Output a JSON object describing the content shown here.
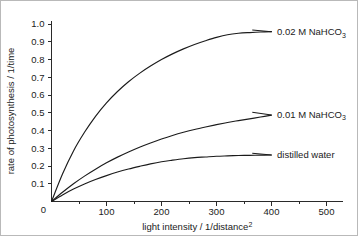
{
  "figure": {
    "background_color": "#ffffff",
    "border_color": "#b9b9b9",
    "line_color": "#1b1b1b"
  },
  "chart_data": {
    "type": "line",
    "title": "",
    "xlabel": "light intensity / 1/distance²",
    "xlabel_base": "light intensity / 1/distance",
    "xlabel_exponent": "2",
    "ylabel": "rate of photosynthesis / 1/time",
    "xlim": [
      0,
      530
    ],
    "ylim": [
      0,
      1.02
    ],
    "grid": false,
    "legend_position": "inline-right-of-curve-end",
    "x_ticks_major": [
      0,
      100,
      200,
      300,
      400,
      500
    ],
    "x_tick_labels": [
      "0",
      "100",
      "200",
      "300",
      "400",
      "500"
    ],
    "x_ticks_minor": [
      50,
      150,
      250,
      350,
      450
    ],
    "y_ticks_major": [
      0,
      0.1,
      0.2,
      0.3,
      0.4,
      0.5,
      0.6,
      0.7,
      0.8,
      0.9,
      1.0
    ],
    "y_tick_labels": [
      "0",
      "0.1",
      "0.2",
      "0.3",
      "0.4",
      "0.5",
      "0.6",
      "0.7",
      "0.8",
      "0.9",
      "1.0"
    ],
    "x": [
      0,
      20,
      40,
      60,
      80,
      100,
      120,
      140,
      160,
      180,
      200,
      220,
      240,
      260,
      280,
      300,
      320,
      340,
      360,
      380,
      400
    ],
    "series": [
      {
        "name": "0.02 M  NaHCO3",
        "label_base": "0.02 M   NaHCO",
        "label_sub": "3",
        "plateau": 0.96,
        "half_saturation": 120,
        "color": "#1b1b1b",
        "label_x": 410,
        "label_y": 0.955,
        "values": [
          0.0,
          0.155,
          0.285,
          0.39,
          0.48,
          0.556,
          0.62,
          0.675,
          0.722,
          0.763,
          0.8,
          0.832,
          0.86,
          0.885,
          0.906,
          0.925,
          0.94,
          0.948,
          0.952,
          0.955,
          0.957
        ]
      },
      {
        "name": "0.01 M  NaHCO3",
        "label_base": "0.01 M   NaHCO",
        "label_sub": "3",
        "plateau": 0.49,
        "half_saturation": 200,
        "color": "#1b1b1b",
        "label_x": 410,
        "label_y": 0.49,
        "values": [
          0.0,
          0.052,
          0.1,
          0.143,
          0.182,
          0.218,
          0.25,
          0.279,
          0.306,
          0.33,
          0.352,
          0.372,
          0.39,
          0.406,
          0.42,
          0.433,
          0.445,
          0.456,
          0.466,
          0.476,
          0.487
        ]
      },
      {
        "name": "distilled water",
        "label_base": "distilled water",
        "label_sub": "",
        "plateau": 0.26,
        "half_saturation": 150,
        "color": "#1b1b1b",
        "label_x": 410,
        "label_y": 0.262,
        "values": [
          0.0,
          0.037,
          0.07,
          0.099,
          0.124,
          0.146,
          0.166,
          0.183,
          0.198,
          0.212,
          0.224,
          0.233,
          0.241,
          0.247,
          0.251,
          0.255,
          0.257,
          0.259,
          0.26,
          0.261,
          0.262
        ]
      }
    ],
    "leader_lines": [
      {
        "name": "leader-0.02M",
        "x1": 365,
        "y1": 0.966,
        "x2": 400,
        "y2": 0.957
      },
      {
        "name": "leader-0.01M",
        "x1": 365,
        "y1": 0.503,
        "x2": 400,
        "y2": 0.487
      },
      {
        "name": "leader-distilled",
        "x1": 365,
        "y1": 0.272,
        "x2": 400,
        "y2": 0.262
      }
    ]
  }
}
